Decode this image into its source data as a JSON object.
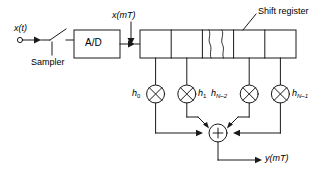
{
  "diagram": {
    "type": "block-diagram",
    "stroke_color": "#1a1a1a",
    "background_color": "#ffffff",
    "labels": {
      "input_signal": "x(t)",
      "sampler": "Sampler",
      "converter": "A/D",
      "sampled_signal": "x(mT)",
      "shift_register": "Shift register",
      "output_signal": "y(mT)",
      "summer_symbol": "+"
    },
    "coefficients": [
      {
        "base": "h",
        "sub": "0",
        "full": "h0",
        "tap_index": 0
      },
      {
        "base": "h",
        "sub": "1",
        "full": "h1",
        "tap_index": 1
      },
      {
        "base": "h",
        "sub": "N–2",
        "full": "hN-2",
        "tap_index": 3
      },
      {
        "base": "h",
        "sub": "N–1",
        "full": "hN-1",
        "tap_index": 4
      }
    ],
    "shift_register": {
      "cell_count": 5,
      "break_cell_index": 2,
      "note": "middle cell drawn with a jagged break indicating omitted stages"
    },
    "multipliers": {
      "count": 4,
      "symbol": "circle-with-x"
    },
    "summer": {
      "symbol": "circle-with-plus",
      "input_count": 4
    }
  }
}
